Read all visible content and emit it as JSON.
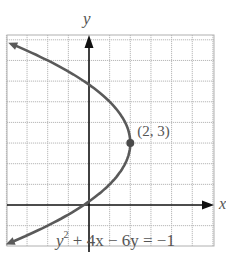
{
  "chart_data": {
    "type": "line",
    "title": "",
    "equation": "y² + 4x − 6y = −1",
    "equation_parts": {
      "y": "y",
      "sup": "2",
      "rest": " + 4x − 6y = −1"
    },
    "xlabel": "x",
    "ylabel": "y",
    "xlim": [
      -4,
      6
    ],
    "ylim": [
      -2,
      8.2
    ],
    "grid": true,
    "grid_step": 1,
    "curve": "parabola x = -(y-3)^2/4 + 2, opening left",
    "vertex": {
      "x": 2,
      "y": 3,
      "label": "(2, 3)"
    },
    "series": [
      {
        "name": "y^2 + 4x - 6y = -1",
        "points": [
          {
            "x": -3.76,
            "y": 7.8
          },
          {
            "x": -2.0,
            "y": 7.0
          },
          {
            "x": -0.25,
            "y": 6.0
          },
          {
            "x": 1.0,
            "y": 5.0
          },
          {
            "x": 1.75,
            "y": 4.0
          },
          {
            "x": 2.0,
            "y": 3.0
          },
          {
            "x": 1.75,
            "y": 2.0
          },
          {
            "x": 1.0,
            "y": 1.0
          },
          {
            "x": -0.25,
            "y": 0.0
          },
          {
            "x": -2.0,
            "y": -1.0
          },
          {
            "x": -3.88,
            "y": -1.85
          }
        ]
      }
    ],
    "colors": {
      "curve": "#5a5a5a",
      "axis": "#111111",
      "grid": "#b8b8b8",
      "text": "#555555"
    }
  },
  "labels": {
    "x_axis": "x",
    "y_axis": "y",
    "vertex": "(2, 3)",
    "eq_y": "y",
    "eq_sup": "2",
    "eq_rest": " + 4x − 6y = −1"
  }
}
